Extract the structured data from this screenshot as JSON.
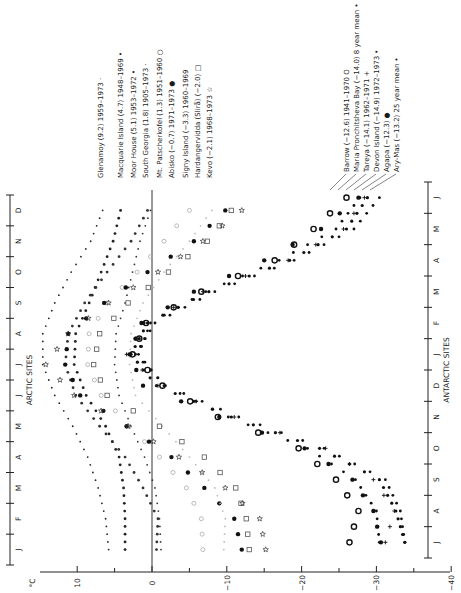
{
  "chart_data": {
    "type": "scatter",
    "title": "",
    "orientation": "rotated 90° (temperature on horizontal axis, months on vertical axes)",
    "xlabel": "°C",
    "xlim": [
      10,
      -40
    ],
    "x_ticks": [
      "10",
      "0",
      "-10",
      "-20",
      "-30",
      "-40"
    ],
    "zero_line": true,
    "axes": {
      "arctic": {
        "label": "ARCTIC SITES",
        "months": [
          "J",
          "F",
          "M",
          "A",
          "M",
          "J",
          "J",
          "A",
          "S",
          "O",
          "N",
          "D"
        ]
      },
      "antarctic": {
        "label": "ANTARCTIC SITES",
        "months": [
          "J",
          "A",
          "S",
          "O",
          "N",
          "D",
          "J",
          "F",
          "M",
          "A",
          "M",
          "J"
        ]
      }
    },
    "series": [
      {
        "group": "arctic",
        "name": "Glenamoy",
        "legend": "Glenamoy (9.2) 1959-1973",
        "mean": 9.2,
        "marker": "small-dot",
        "color": "#222222",
        "values": [
          5.8,
          6.2,
          7.2,
          8.6,
          10.6,
          13.0,
          14.6,
          14.6,
          13.0,
          10.8,
          8.2,
          6.6
        ]
      },
      {
        "group": "arctic",
        "name": "Macquarie Island",
        "legend": "Macquarie Island (4.7) 1948-1969",
        "mean": 4.7,
        "marker": "dot",
        "color": "#222222",
        "values": [
          3.6,
          3.6,
          3.8,
          4.4,
          6.2,
          8.8,
          10.4,
          10.2,
          8.4,
          6.8,
          5.2,
          4.2
        ]
      },
      {
        "group": "arctic",
        "name": "Moor House",
        "legend": "Moor House (5.1) 1953-1972",
        "mean": 5.1,
        "marker": "dot",
        "color": "#333333",
        "values": [
          -0.6,
          -0.8,
          1.2,
          3.6,
          7.0,
          10.2,
          11.6,
          11.2,
          9.0,
          6.0,
          2.8,
          0.6
        ]
      },
      {
        "group": "arctic",
        "name": "South Georgia",
        "legend": "South Georgia (1.8) 1905-1973",
        "mean": 1.8,
        "marker": "small-dot",
        "color": "#333333",
        "values": [
          -1.2,
          -1.0,
          -0.4,
          1.0,
          2.8,
          4.4,
          5.0,
          4.8,
          3.6,
          2.6,
          1.6,
          0.2
        ]
      },
      {
        "group": "arctic",
        "name": "Mt. Patscherkofel",
        "legend": "Mt. Patscherkofel (1.3) 1951-1960",
        "mean": 1.3,
        "marker": "open-circle",
        "color": "#aaaaaa",
        "values": [
          -6.8,
          -6.6,
          -4.6,
          -1.0,
          3.0,
          6.8,
          8.6,
          8.4,
          6.0,
          2.0,
          -1.6,
          -5.0
        ]
      },
      {
        "group": "arctic",
        "name": "Abisko",
        "legend": "Abisko (-0.7) 1971-1973",
        "mean": -0.7,
        "marker": "filled-circle",
        "color": "#111111",
        "values": [
          -12.0,
          -11.0,
          -7.0,
          -2.6,
          3.4,
          9.6,
          11.6,
          11.2,
          6.4,
          0.6,
          -5.6,
          -9.8
        ]
      },
      {
        "group": "arctic",
        "name": "Signy Island",
        "legend": "Signy Island (-3.3) 1960-1969",
        "mean": -3.3,
        "marker": "small-dot",
        "color": "#bbbbbb",
        "values": [
          -9.6,
          -9.8,
          -8.4,
          -5.0,
          -1.4,
          2.2,
          3.0,
          2.8,
          1.2,
          -1.6,
          -5.0,
          -8.0
        ]
      },
      {
        "group": "arctic",
        "name": "Hardangervidda (Slirå)",
        "legend": "Hardangervidda (Slirå) (-2.0)",
        "mean": -2.0,
        "marker": "open-square",
        "color": "#555555",
        "values": [
          -13.0,
          -12.6,
          -11.2,
          -7.0,
          -1.0,
          6.0,
          7.8,
          7.0,
          3.2,
          -2.2,
          -7.4,
          -10.6
        ]
      },
      {
        "group": "arctic",
        "name": "Kevo",
        "legend": "Kevo (-2.1) 1968-1973",
        "mean": -2.1,
        "marker": "open-star",
        "color": "#333333",
        "values": [
          -15.2,
          -14.4,
          -9.8,
          -3.6,
          3.2,
          10.4,
          14.2,
          11.2,
          5.8,
          -0.8,
          -6.8,
          -12.0
        ]
      },
      {
        "group": "antarctic",
        "name": "Barrow",
        "legend": "Barrow (-12.6) 1941-1970",
        "mean": -12.6,
        "marker": "open-circle-bold",
        "color": "#111111",
        "values": [
          -26.4,
          -27.6,
          -24.6,
          -19.6,
          -8.8,
          -1.4,
          2.6,
          0.8,
          -6.6,
          -16.4,
          -21.6,
          -26.0
        ]
      },
      {
        "group": "antarctic",
        "name": "Maria Pronchitsheva Bay",
        "legend": "Maria Pronchitsheva Bay (-14.0) 8 year mean",
        "mean": -14.0,
        "marker": "dot",
        "color": "#111111",
        "values": [
          -30.4,
          -30.0,
          -27.2,
          -20.8,
          -10.2,
          -1.6,
          1.8,
          0.2,
          -7.2,
          -17.0,
          -24.6,
          -27.8
        ]
      },
      {
        "group": "antarctic",
        "name": "Tareya",
        "legend": "Tareya (-14.1) 1962-1971",
        "mean": -14.1,
        "marker": "cross",
        "color": "#111111",
        "values": [
          -31.2,
          -32.4,
          -29.6,
          -23.2,
          -11.0,
          -0.8,
          3.4,
          1.0,
          -6.8,
          -18.2,
          -25.6,
          -28.4
        ]
      },
      {
        "group": "antarctic",
        "name": "Devon Island",
        "legend": "Devon Island (-14.9) 1972-1973",
        "mean": -14.9,
        "marker": "dot",
        "color": "#111111",
        "values": [
          -33.8,
          -33.2,
          -31.2,
          -23.0,
          -11.6,
          -1.8,
          2.2,
          -0.4,
          -8.4,
          -19.0,
          -27.0,
          -30.4
        ]
      },
      {
        "group": "antarctic",
        "name": "Agapa",
        "legend": "Agapa (-12.3)",
        "mean": -12.3,
        "marker": "filled-circle",
        "color": "#111111",
        "values": [
          -30.6,
          -29.6,
          -26.8,
          -20.4,
          -9.0,
          1.2,
          3.0,
          1.4,
          -5.6,
          -15.0,
          -22.6,
          -27.6
        ]
      },
      {
        "group": "antarctic",
        "name": "Ary-Mas",
        "legend": "Ary-Mas (-13.2) 25 year mean",
        "mean": -13.2,
        "marker": "small-filled",
        "color": "#111111",
        "values": [
          -33.8,
          -32.6,
          -30.4,
          -22.4,
          -10.6,
          -0.6,
          2.8,
          0.6,
          -7.6,
          -18.4,
          -26.0,
          -28.8
        ]
      }
    ]
  },
  "axis_labels": {
    "unit": "°C",
    "arctic": "ARCTIC SITES",
    "antarctic": "ANTARCTIC SITES"
  },
  "legend_arctic": [
    {
      "text": "Glenamoy (9.2) 1959–1973",
      "sym": "·"
    },
    {
      "text": "Macquarie Island (4.7) 1948–1969",
      "sym": "•"
    },
    {
      "text": "Moor House (5.1) 1953–1972",
      "sym": "•"
    },
    {
      "text": "South Georgia (1.8) 1905–1973",
      "sym": "·"
    },
    {
      "text": "Mt. Patscherkofel (1.3) 1951–1960",
      "sym": "○"
    },
    {
      "text": "Abisko (−0.7) 1971–1973",
      "sym": "●"
    },
    {
      "text": "Signy Island (−3.3) 1960–1969",
      "sym": ""
    },
    {
      "text": "Hardangervidda (Slirå) (−2.0)",
      "sym": "□"
    },
    {
      "text": "Kevo (−2.1) 1968–1973",
      "sym": "☆"
    }
  ],
  "legend_antarctic": [
    {
      "text": "Barrow (−12.6) 1941–1970",
      "sym": "O"
    },
    {
      "text": "Maria Pronchitsheva Bay (−14.0) 8 year mean",
      "sym": "•"
    },
    {
      "text": "Tareya (−14.1) 1962–1971",
      "sym": "+"
    },
    {
      "text": "Devon Island (−14.9) 1972–1973",
      "sym": "•"
    },
    {
      "text": "Agapa (−12.3)",
      "sym": "●"
    },
    {
      "text": "Ary-Mas (−13.2) 25 year mean",
      "sym": "•"
    }
  ]
}
